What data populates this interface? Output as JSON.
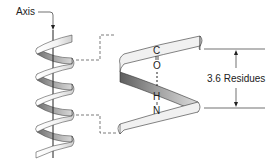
{
  "diagram": {
    "labels": {
      "axis": "Axis",
      "residues": "3.6 Residues",
      "atom_c": "C",
      "atom_o": "O",
      "atom_h": "H",
      "atom_n": "N"
    },
    "colors": {
      "ribbon_front": "#f2f2f2",
      "ribbon_back": "#9a9a9a",
      "outline": "#333333",
      "text": "#222222"
    }
  }
}
